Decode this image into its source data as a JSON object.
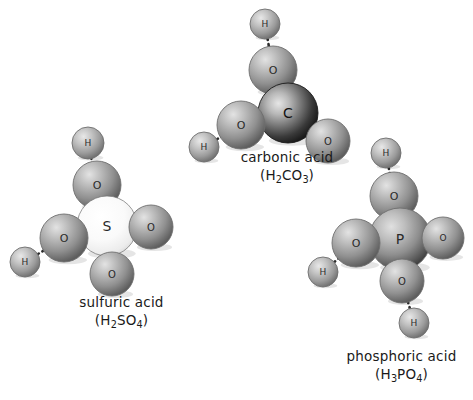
{
  "figure": {
    "background": "#ffffff",
    "atom_colors": {
      "hydrogen": "#9a9a9a",
      "oxygen": "#8f8f8f",
      "sulfur": "#f2f2f2",
      "carbon": "#3a3a3a",
      "phosphorus": "#777777",
      "bond": "#2b2b2b",
      "outline": "#5a5a5a",
      "label_text": "#1a1a1a"
    }
  },
  "molecules": [
    {
      "id": "sulfuric-acid",
      "name": "sulfuric acid",
      "formula_parts": [
        {
          "text": "(H"
        },
        {
          "text": "2",
          "sub": true
        },
        {
          "text": "SO"
        },
        {
          "text": "4",
          "sub": true
        },
        {
          "text": ")"
        }
      ],
      "formula_plain": "(H2SO4)",
      "center_atom": "S",
      "atoms": [
        {
          "element": "H",
          "label": "H",
          "cx": 88,
          "cy": 143,
          "r": 16
        },
        {
          "element": "O",
          "label": "O",
          "cx": 97,
          "cy": 185,
          "r": 24
        },
        {
          "element": "S",
          "label": "S",
          "cx": 107,
          "cy": 226,
          "r": 30
        },
        {
          "element": "O",
          "label": "O",
          "cx": 64,
          "cy": 238,
          "r": 24
        },
        {
          "element": "H",
          "label": "H",
          "cx": 25,
          "cy": 262,
          "r": 15
        },
        {
          "element": "O",
          "label": "O",
          "cx": 151,
          "cy": 227,
          "r": 22
        },
        {
          "element": "O",
          "label": "O",
          "cx": 112,
          "cy": 274,
          "r": 22
        }
      ],
      "bonds": [
        {
          "from": [
            88,
            143
          ],
          "to": [
            97,
            185
          ]
        },
        {
          "from": [
            25,
            262
          ],
          "to": [
            64,
            238
          ]
        }
      ]
    },
    {
      "id": "carbonic-acid",
      "name": "carbonic acid",
      "formula_parts": [
        {
          "text": "(H"
        },
        {
          "text": "2",
          "sub": true
        },
        {
          "text": "CO"
        },
        {
          "text": "3",
          "sub": true
        },
        {
          "text": ")"
        }
      ],
      "formula_plain": "(H2CO3)",
      "center_atom": "C",
      "atoms": [
        {
          "element": "H",
          "label": "H",
          "cx": 265,
          "cy": 24,
          "r": 15
        },
        {
          "element": "O",
          "label": "O",
          "cx": 273,
          "cy": 70,
          "r": 24
        },
        {
          "element": "C",
          "label": "C",
          "cx": 288,
          "cy": 113,
          "r": 30
        },
        {
          "element": "O",
          "label": "O",
          "cx": 241,
          "cy": 125,
          "r": 24
        },
        {
          "element": "H",
          "label": "H",
          "cx": 204,
          "cy": 147,
          "r": 15
        },
        {
          "element": "O",
          "label": "O",
          "cx": 328,
          "cy": 141,
          "r": 22
        }
      ],
      "bonds": [
        {
          "from": [
            265,
            24
          ],
          "to": [
            273,
            70
          ]
        },
        {
          "from": [
            204,
            147
          ],
          "to": [
            241,
            125
          ]
        }
      ]
    },
    {
      "id": "phosphoric-acid",
      "name": "phosphoric acid",
      "formula_parts": [
        {
          "text": "(H"
        },
        {
          "text": "3",
          "sub": true
        },
        {
          "text": "PO"
        },
        {
          "text": "4",
          "sub": true
        },
        {
          "text": ")"
        }
      ],
      "formula_plain": "(H3PO4)",
      "center_atom": "P",
      "atoms": [
        {
          "element": "H",
          "label": "H",
          "cx": 386,
          "cy": 153,
          "r": 15
        },
        {
          "element": "O",
          "label": "O",
          "cx": 394,
          "cy": 196,
          "r": 24
        },
        {
          "element": "P",
          "label": "P",
          "cx": 400,
          "cy": 239,
          "r": 31
        },
        {
          "element": "O",
          "label": "O",
          "cx": 356,
          "cy": 243,
          "r": 24
        },
        {
          "element": "H",
          "label": "H",
          "cx": 323,
          "cy": 272,
          "r": 15
        },
        {
          "element": "O",
          "label": "O",
          "cx": 443,
          "cy": 238,
          "r": 21
        },
        {
          "element": "O",
          "label": "O",
          "cx": 402,
          "cy": 281,
          "r": 22
        },
        {
          "element": "H",
          "label": "H",
          "cx": 414,
          "cy": 323,
          "r": 15
        }
      ],
      "bonds": [
        {
          "from": [
            386,
            153
          ],
          "to": [
            394,
            196
          ]
        },
        {
          "from": [
            323,
            272
          ],
          "to": [
            356,
            243
          ]
        },
        {
          "from": [
            402,
            281
          ],
          "to": [
            414,
            323
          ]
        }
      ]
    }
  ]
}
